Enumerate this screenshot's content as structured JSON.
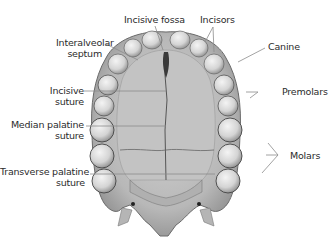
{
  "diagram": {
    "colors": {
      "bone": "#c9c9c9",
      "bone_dark": "#8a8a8a",
      "teeth": "#e6e6e6",
      "outline": "#555555",
      "leader": "#8c8c8c",
      "text": "#2b2b2b"
    },
    "labels": {
      "incisive_fossa": "Incisive fossa",
      "incisors": "Incisors",
      "interalveolar_septum_1": "Interalveolar",
      "interalveolar_septum_2": "septum",
      "canine": "Canine",
      "incisive_suture_1": "Incisive",
      "incisive_suture_2": "suture",
      "premolars": "Premolars",
      "median_palatine_suture_1": "Median palatine",
      "median_palatine_suture_2": "suture",
      "molars": "Molars",
      "transverse_palatine_suture_1": "Transverse palatine",
      "transverse_palatine_suture_2": "suture"
    }
  }
}
